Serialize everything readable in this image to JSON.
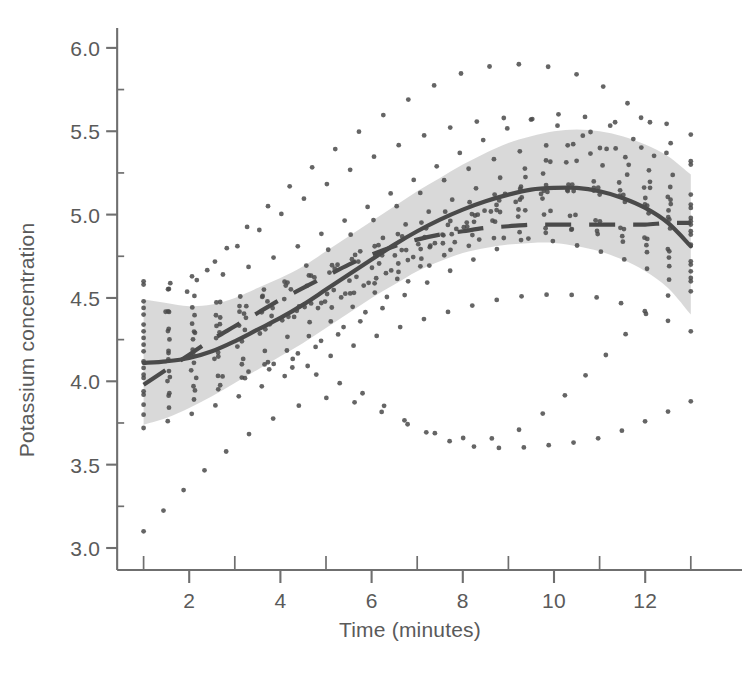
{
  "figure": {
    "name": "potassium-concentration-over-time",
    "background": "#ffffff",
    "axis_color": "#6f6f6f",
    "curve_color": "#4a4a4a",
    "band_color": "#d6d6d6",
    "point_color": "#4a4a4a"
  },
  "chart_data": {
    "type": "line",
    "title": "",
    "xlabel": "Time (minutes)",
    "ylabel": "Potassium concentration",
    "xlim": [
      0.3,
      13.6
    ],
    "ylim": [
      2.88,
      6.25
    ],
    "grid": false,
    "legend": "none",
    "xticks": [
      2,
      4,
      6,
      8,
      10,
      12
    ],
    "xticklabels": [
      "2",
      "4",
      "6",
      "8",
      "10",
      "12"
    ],
    "xminorticks": [
      1,
      3,
      5,
      7,
      9,
      11,
      13
    ],
    "yticks": [
      3.0,
      3.5,
      4.0,
      4.5,
      5.0,
      5.5,
      6.0
    ],
    "yticklabels": [
      "3.0",
      "3.5",
      "4.0",
      "4.5",
      "5.0",
      "5.5",
      "6.0"
    ],
    "yminorticks": [
      3.25,
      3.75,
      4.25,
      4.75,
      5.25,
      5.75
    ],
    "series": [
      {
        "name": "fitted mean curve",
        "style": "solid",
        "x": [
          1.0,
          1.5,
          2.0,
          2.5,
          3.0,
          3.5,
          4.0,
          4.5,
          5.0,
          5.5,
          6.0,
          6.5,
          7.0,
          7.5,
          8.0,
          8.5,
          9.0,
          9.5,
          10.0,
          10.5,
          11.0,
          11.5,
          12.0,
          12.5,
          13.0
        ],
        "values": [
          4.11,
          4.12,
          4.14,
          4.18,
          4.24,
          4.31,
          4.38,
          4.46,
          4.55,
          4.64,
          4.73,
          4.82,
          4.9,
          4.97,
          5.03,
          5.08,
          5.12,
          5.15,
          5.16,
          5.16,
          5.14,
          5.1,
          5.04,
          4.95,
          4.81
        ]
      },
      {
        "name": "confidence band upper",
        "style": "band-edge",
        "x": [
          1.0,
          1.5,
          2.0,
          2.5,
          3.0,
          3.5,
          4.0,
          4.5,
          5.0,
          5.5,
          6.0,
          6.5,
          7.0,
          7.5,
          8.0,
          8.5,
          9.0,
          9.5,
          10.0,
          10.5,
          11.0,
          11.5,
          12.0,
          12.5,
          13.0
        ],
        "values": [
          4.49,
          4.47,
          4.45,
          4.46,
          4.5,
          4.56,
          4.62,
          4.69,
          4.78,
          4.87,
          4.96,
          5.05,
          5.14,
          5.22,
          5.3,
          5.37,
          5.43,
          5.47,
          5.5,
          5.51,
          5.5,
          5.47,
          5.42,
          5.35,
          5.24
        ]
      },
      {
        "name": "confidence band lower",
        "style": "band-edge",
        "x": [
          1.0,
          1.5,
          2.0,
          2.5,
          3.0,
          3.5,
          4.0,
          4.5,
          5.0,
          5.5,
          6.0,
          6.5,
          7.0,
          7.5,
          8.0,
          8.5,
          9.0,
          9.5,
          10.0,
          10.5,
          11.0,
          11.5,
          12.0,
          12.5,
          13.0
        ],
        "values": [
          3.74,
          3.78,
          3.84,
          3.91,
          3.99,
          4.07,
          4.15,
          4.23,
          4.32,
          4.41,
          4.5,
          4.58,
          4.66,
          4.72,
          4.77,
          4.8,
          4.82,
          4.83,
          4.83,
          4.81,
          4.78,
          4.73,
          4.66,
          4.56,
          4.4
        ]
      },
      {
        "name": "comparison curve",
        "style": "dashed",
        "x": [
          1.0,
          1.5,
          2.0,
          2.5,
          3.0,
          3.5,
          4.0,
          4.5,
          5.0,
          5.5,
          6.0,
          6.5,
          7.0,
          7.5,
          8.0,
          8.5,
          9.0,
          9.5,
          10.0,
          10.5,
          11.0,
          11.5,
          12.0,
          12.5,
          13.0
        ],
        "values": [
          3.98,
          4.07,
          4.16,
          4.25,
          4.33,
          4.41,
          4.49,
          4.56,
          4.63,
          4.7,
          4.76,
          4.81,
          4.85,
          4.88,
          4.9,
          4.92,
          4.93,
          4.94,
          4.94,
          4.94,
          4.94,
          4.94,
          4.94,
          4.95,
          4.95
        ]
      },
      {
        "name": "subject profile 1",
        "style": "dotted",
        "x": [
          1,
          2,
          3,
          4,
          5,
          6,
          7,
          8,
          9,
          10,
          11,
          12,
          13
        ],
        "values": [
          4.3,
          4.55,
          4.85,
          5.12,
          5.35,
          5.55,
          5.72,
          5.85,
          5.9,
          5.88,
          5.78,
          5.58,
          5.3
        ]
      },
      {
        "name": "subject profile 2",
        "style": "dotted",
        "x": [
          1,
          2,
          3,
          4,
          5,
          6,
          7,
          8,
          9,
          10,
          11,
          12,
          13
        ],
        "values": [
          4.58,
          4.6,
          4.66,
          4.76,
          4.9,
          5.06,
          5.22,
          5.38,
          5.52,
          5.6,
          5.56,
          5.4,
          5.12
        ]
      },
      {
        "name": "subject profile 3",
        "style": "dotted",
        "x": [
          1,
          2,
          3,
          4,
          5,
          6,
          7,
          8,
          9,
          10,
          11,
          12,
          13
        ],
        "values": [
          4.6,
          4.52,
          4.46,
          4.44,
          4.48,
          4.58,
          4.72,
          4.92,
          5.14,
          5.36,
          5.52,
          5.58,
          5.48
        ]
      },
      {
        "name": "subject profile 4",
        "style": "dotted",
        "x": [
          1,
          2,
          3,
          4,
          5,
          6,
          7,
          8,
          9,
          10,
          11,
          12,
          13
        ],
        "values": [
          4.22,
          4.28,
          4.38,
          4.52,
          4.66,
          4.82,
          4.98,
          5.12,
          5.24,
          5.32,
          5.3,
          5.18,
          4.96
        ]
      },
      {
        "name": "subject profile 5",
        "style": "dotted",
        "x": [
          1,
          2,
          3,
          4,
          5,
          6,
          7,
          8,
          9,
          10,
          11,
          12,
          13
        ],
        "values": [
          4.02,
          4.1,
          4.22,
          4.36,
          4.52,
          4.68,
          4.84,
          4.98,
          5.08,
          5.14,
          5.12,
          5.02,
          4.82
        ]
      },
      {
        "name": "subject profile 6",
        "style": "dotted",
        "x": [
          1,
          2,
          3,
          4,
          5,
          6,
          7,
          8,
          9,
          10,
          11,
          12,
          13
        ],
        "values": [
          3.92,
          3.94,
          4.0,
          4.1,
          4.24,
          4.4,
          4.56,
          4.7,
          4.82,
          4.9,
          4.9,
          4.82,
          4.66
        ]
      },
      {
        "name": "subject profile 7",
        "style": "dotted",
        "x": [
          1,
          2,
          3,
          4,
          5,
          6,
          7,
          8,
          9,
          10,
          11,
          12,
          13
        ],
        "values": [
          3.72,
          3.8,
          3.9,
          4.02,
          4.14,
          4.26,
          4.36,
          4.44,
          4.5,
          4.52,
          4.5,
          4.42,
          4.3
        ]
      },
      {
        "name": "subject profile 8",
        "style": "dotted",
        "x": [
          1,
          2,
          3,
          4,
          5,
          6,
          7,
          8,
          9,
          10,
          11,
          12,
          13
        ],
        "values": [
          3.1,
          3.38,
          3.62,
          3.8,
          3.9,
          3.84,
          3.72,
          3.66,
          3.68,
          3.86,
          4.12,
          4.4,
          4.62
        ]
      },
      {
        "name": "subject profile 9",
        "style": "dotted",
        "x": [
          1,
          2,
          3,
          4,
          5,
          6,
          7,
          8,
          9,
          10,
          11,
          12,
          13
        ],
        "values": [
          4.18,
          4.16,
          4.14,
          4.1,
          4.02,
          3.9,
          3.72,
          3.62,
          3.6,
          3.62,
          3.66,
          3.76,
          3.88
        ]
      },
      {
        "name": "subject profile 10",
        "style": "dotted",
        "x": [
          1,
          2,
          3,
          4,
          5,
          6,
          7,
          8,
          9,
          10,
          11,
          12,
          13
        ],
        "values": [
          4.4,
          4.44,
          4.5,
          4.58,
          4.66,
          4.74,
          4.8,
          4.84,
          4.86,
          4.84,
          4.78,
          4.68,
          4.54
        ]
      },
      {
        "name": "subject profile 11",
        "style": "dotted",
        "x": [
          1,
          2,
          3,
          4,
          5,
          6,
          7,
          8,
          9,
          10,
          11,
          12,
          13
        ],
        "values": [
          4.48,
          4.62,
          4.8,
          5.0,
          5.18,
          5.34,
          5.46,
          5.54,
          5.58,
          5.54,
          5.42,
          5.22,
          4.98
        ]
      },
      {
        "name": "subject profile 12",
        "style": "dotted",
        "x": [
          1,
          2,
          3,
          4,
          5,
          6,
          7,
          8,
          9,
          10,
          11,
          12,
          13
        ],
        "values": [
          3.86,
          3.96,
          4.08,
          4.24,
          4.42,
          4.6,
          4.78,
          4.94,
          5.06,
          5.14,
          5.14,
          5.06,
          4.9
        ]
      },
      {
        "name": "subject profile 13",
        "style": "dotted",
        "x": [
          1,
          2,
          3,
          4,
          5,
          6,
          7,
          8,
          9,
          10,
          11,
          12,
          13
        ],
        "values": [
          4.12,
          4.24,
          4.4,
          4.58,
          4.78,
          4.96,
          5.12,
          5.26,
          5.36,
          5.42,
          5.4,
          5.28,
          5.06
        ]
      },
      {
        "name": "subject profile 14",
        "style": "dotted",
        "x": [
          1,
          2,
          3,
          4,
          5,
          6,
          7,
          8,
          9,
          10,
          11,
          12,
          13
        ],
        "values": [
          4.26,
          4.34,
          4.44,
          4.56,
          4.68,
          4.8,
          4.9,
          4.98,
          5.02,
          5.02,
          4.96,
          4.86,
          4.7
        ]
      },
      {
        "name": "subject profile 15",
        "style": "dotted",
        "x": [
          1,
          2,
          3,
          4,
          5,
          6,
          7,
          8,
          9,
          10,
          11,
          12,
          13
        ],
        "values": [
          4.04,
          4.02,
          4.04,
          4.12,
          4.26,
          4.44,
          4.64,
          4.84,
          5.0,
          5.12,
          5.16,
          5.1,
          4.94
        ]
      },
      {
        "name": "subject profile 16",
        "style": "dotted",
        "x": [
          1,
          2,
          3,
          4,
          5,
          6,
          7,
          8,
          9,
          10,
          11,
          12,
          13
        ],
        "values": [
          3.8,
          3.88,
          4.0,
          4.16,
          4.34,
          4.52,
          4.68,
          4.8,
          4.88,
          4.92,
          4.88,
          4.78,
          4.6
        ]
      },
      {
        "name": "subject profile 17",
        "style": "dotted",
        "x": [
          1,
          2,
          3,
          4,
          5,
          6,
          7,
          8,
          9,
          10,
          11,
          12,
          13
        ],
        "values": [
          4.34,
          4.3,
          4.3,
          4.36,
          4.46,
          4.6,
          4.76,
          4.92,
          5.06,
          5.16,
          5.2,
          5.16,
          5.04
        ]
      },
      {
        "name": "subject profile 18",
        "style": "dotted",
        "x": [
          1,
          2,
          3,
          4,
          5,
          6,
          7,
          8,
          9,
          10,
          11,
          12,
          13
        ],
        "values": [
          4.44,
          4.4,
          4.38,
          4.4,
          4.48,
          4.6,
          4.76,
          4.94,
          5.12,
          5.28,
          5.38,
          5.4,
          5.32
        ]
      },
      {
        "name": "subject profile 19",
        "style": "dotted",
        "x": [
          1,
          2,
          3,
          4,
          5,
          6,
          7,
          8,
          9,
          10,
          11,
          12,
          13
        ],
        "values": [
          4.08,
          4.18,
          4.32,
          4.48,
          4.64,
          4.8,
          4.94,
          5.06,
          5.14,
          5.18,
          5.16,
          5.06,
          4.88
        ]
      },
      {
        "name": "subject profile 20",
        "style": "dotted",
        "x": [
          1,
          2,
          3,
          4,
          5,
          6,
          7,
          8,
          9,
          10,
          11,
          12,
          13
        ],
        "values": [
          3.94,
          4.06,
          4.2,
          4.36,
          4.52,
          4.68,
          4.82,
          4.92,
          4.98,
          5.0,
          4.96,
          4.86,
          4.72
        ]
      }
    ]
  }
}
